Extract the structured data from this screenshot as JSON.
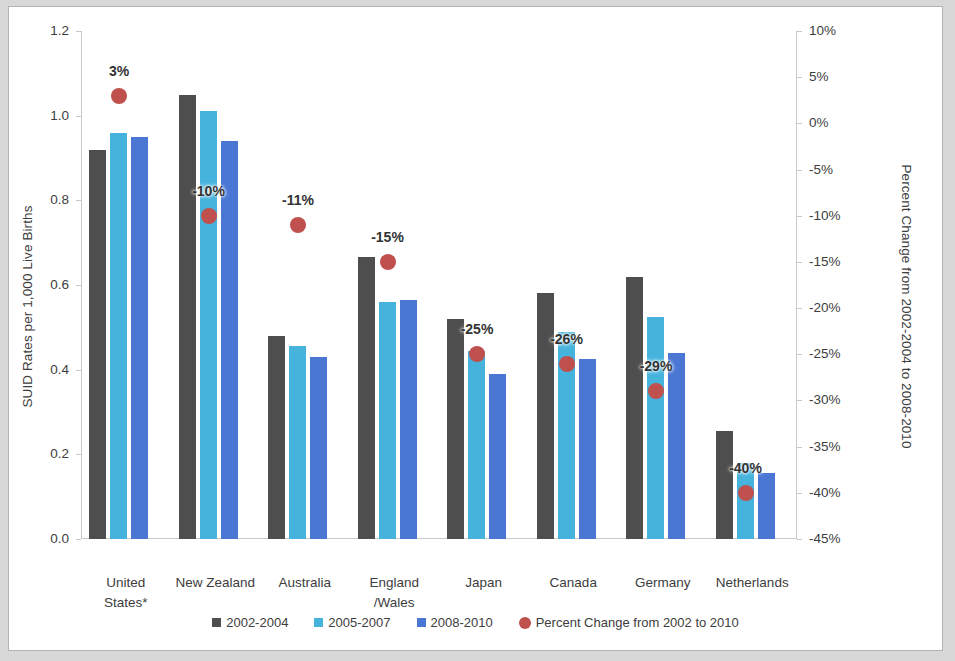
{
  "chart_data": {
    "type": "bar",
    "title": "",
    "categories": [
      "United States*",
      "New Zealand",
      "Australia",
      "England\n/Wales",
      "Japan",
      "Canada",
      "Germany",
      "Netherlands"
    ],
    "category_lines": [
      [
        "United",
        "States*"
      ],
      [
        "New Zealand",
        ""
      ],
      [
        "Australia",
        ""
      ],
      [
        "England",
        "/Wales"
      ],
      [
        "Japan",
        ""
      ],
      [
        "Canada",
        ""
      ],
      [
        "Germany",
        ""
      ],
      [
        "Netherlands",
        ""
      ]
    ],
    "series": [
      {
        "name": "2002-2004",
        "color": "#4e4e4e",
        "values": [
          0.92,
          1.05,
          0.48,
          0.665,
          0.52,
          0.58,
          0.62,
          0.255
        ]
      },
      {
        "name": "2005-2007",
        "color": "#46b3dd",
        "values": [
          0.96,
          1.01,
          0.455,
          0.56,
          0.445,
          0.49,
          0.525,
          0.18
        ]
      },
      {
        "name": "2008-2010",
        "color": "#4a77d4",
        "values": [
          0.95,
          0.94,
          0.43,
          0.565,
          0.39,
          0.425,
          0.44,
          0.155
        ]
      }
    ],
    "overlay": {
      "name": "Percent Change from 2002 to 2010",
      "color": "#c0504d",
      "values": [
        3,
        -10,
        -11,
        -15,
        -25,
        -26,
        -29,
        -40
      ],
      "labels": [
        "3%",
        "-10%",
        "-11%",
        "-15%",
        "-25%",
        "-26%",
        "-29%",
        "-40%"
      ]
    },
    "ylabel": "SUID Rates per 1,000 Live Births",
    "ylabel_right": "Percent Change from 2002-2004 to 2008-2010",
    "xlabel": "",
    "ylim": [
      0.0,
      1.2
    ],
    "ylim_right": [
      -45,
      10
    ],
    "yticks": [
      "0.0",
      "0.2",
      "0.4",
      "0.6",
      "0.8",
      "1.0",
      "1.2"
    ],
    "ytick_values": [
      0.0,
      0.2,
      0.4,
      0.6,
      0.8,
      1.0,
      1.2
    ],
    "yticks_right": [
      "10%",
      "5%",
      "0%",
      "-5%",
      "-10%",
      "-15%",
      "-20%",
      "-25%",
      "-30%",
      "-35%",
      "-40%",
      "-45%"
    ],
    "ytick_values_right": [
      10,
      5,
      0,
      -5,
      -10,
      -15,
      -20,
      -25,
      -30,
      -35,
      -40,
      -45
    ],
    "grid": false,
    "legend_position": "bottom",
    "legend": [
      {
        "label": "2002-2004",
        "color": "#4e4e4e",
        "marker": "square"
      },
      {
        "label": "2005-2007",
        "color": "#46b3dd",
        "marker": "square"
      },
      {
        "label": "2008-2010",
        "color": "#4a77d4",
        "marker": "square"
      },
      {
        "label": "Percent Change from 2002 to 2010",
        "color": "#c0504d",
        "marker": "circle"
      }
    ]
  }
}
